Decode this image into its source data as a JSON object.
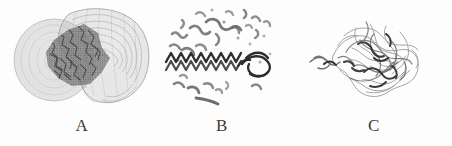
{
  "figure": {
    "background_color": "#fdfdfd",
    "width": 452,
    "height": 146,
    "ink_color": "#4a4a4a",
    "dark_ink_color": "#2b2b2b",
    "mesh_color": "#9a9a9a"
  },
  "panels": [
    {
      "label": "A",
      "name": "panel-a",
      "depiction": "translucent-wireframe-surface-with-embedded-dense-molecule",
      "elements": {
        "outer_surface": "two-lobed dotted wireframe envelope",
        "inner_structure": "dark space-filling / stick molecular core"
      }
    },
    {
      "label": "B",
      "name": "panel-b",
      "depiction": "scattered-fragments-with-alpha-helix-coil",
      "elements": {
        "helix": "dark horizontal zigzag alpha-helix ribbon",
        "fragments": "dispersed small backbone fragments and dots"
      }
    },
    {
      "label": "C",
      "name": "panel-c",
      "depiction": "compact-globular-backbone-trace",
      "elements": {
        "trace": "tangled thin backbone wire trace with darker core regions"
      }
    }
  ]
}
